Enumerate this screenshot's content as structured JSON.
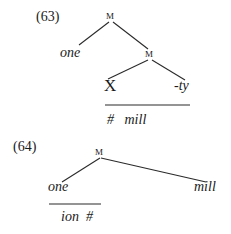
{
  "examples": [
    {
      "number": "(63)",
      "root_node": "M",
      "left_leaf": "one",
      "inner_node": "M",
      "inner_left": "X",
      "inner_right": "-ty",
      "below_line": "#   mill"
    },
    {
      "number": "(64)",
      "root_node": "M",
      "left_leaf": "one",
      "right_leaf": "mill",
      "below_line": "ion  #"
    }
  ]
}
